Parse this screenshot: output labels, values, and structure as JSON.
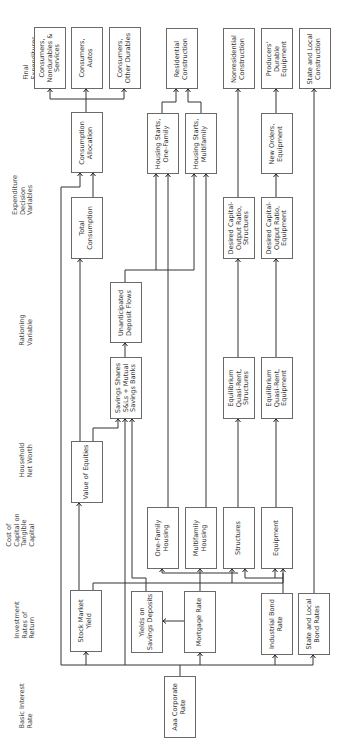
{
  "diagram": {
    "orientation": "rotated 90 degrees counter-clockwise",
    "levels": [
      {
        "id": "final",
        "label": "Final\nExpenditures"
      },
      {
        "id": "expdec",
        "label": "Expenditure\nDecision\nVariables"
      },
      {
        "id": "ration",
        "label": "Rationing\nVariable"
      },
      {
        "id": "hnw",
        "label": "Household\nNet Worth"
      },
      {
        "id": "cost",
        "label": "Cost of\nCapital on\nTangible\nCapital"
      },
      {
        "id": "invest",
        "label": "Investment\nRates of\nReturn"
      },
      {
        "id": "basic",
        "label": "Basic Interest\nRate"
      }
    ],
    "nodes": {
      "cons_nondur": "Consumers,\nNondurables &\nServices",
      "cons_autos": "Consumers,\nAutos",
      "cons_other": "Consumers,\nOther Durables",
      "resid_constr": "Residential\nConstruction",
      "nonres_constr": "Nonresidential\nConstruction",
      "prod_dur_eq": "Producers'\nDurable\nEquipment",
      "sl_constr": "State and Local\nConstruction",
      "cons_alloc": "Consumption\nAllocation",
      "hs_one": "Housing Starts,\nOne-Family",
      "hs_multi": "Housing Starts,\nMultifamily",
      "new_orders": "New Orders,\nEquipment",
      "total_cons": "Total\nConsumption",
      "dko_struct": "Desired Capital-\nOutput Ratio,\nStructures",
      "dko_equip": "Desired Capital-\nOutput Ratio,\nEquipment",
      "unant_dep": "Unanticipated\nDeposit Flows",
      "sav_shares": "Savings Shares\nS&Ls + Mutual\nSavings Banks",
      "eqr_struct": "Equilibrium\nQuasi-Rent,\nStructures",
      "eqr_equip": "Equilibrium\nQuasi-Rent,\nEquipment",
      "val_equities": "Value of Equities",
      "one_fam_h": "One-Family\nHousing",
      "multi_fam_h": "Multifamily\nHousing",
      "structures": "Structures",
      "equipment": "Equipment",
      "stock_yield": "Stock Market\nYield",
      "yields_sav": "Yields on\nSavings Deposits",
      "mortgage": "Mortgage Rate",
      "ind_bond": "Industrial Bond\nRate",
      "sl_bond": "State and Local\nBond Rates",
      "aaa": "Aaa Corporate\nRate"
    }
  }
}
